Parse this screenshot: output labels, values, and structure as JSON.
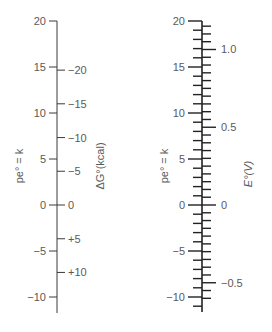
{
  "diagram": {
    "type": "nomogram",
    "left_scale": {
      "axis_label": "pe° = k",
      "secondary_label": "ΔG°(kcal)",
      "pe_range": [
        -11.5,
        20
      ],
      "major_ticks": [
        {
          "pe": 20,
          "label": "20"
        },
        {
          "pe": 15,
          "label": "15"
        },
        {
          "pe": 10,
          "label": "10"
        },
        {
          "pe": 5,
          "label": "5"
        },
        {
          "pe": 0,
          "label": "0"
        },
        {
          "pe": -5,
          "label": "−5"
        },
        {
          "pe": -10,
          "label": "−10"
        }
      ],
      "secondary_ticks": [
        {
          "pe": 14.66,
          "label": "−20"
        },
        {
          "pe": 11.0,
          "label": "−15"
        },
        {
          "pe": 7.33,
          "label": "−10"
        },
        {
          "pe": 3.67,
          "label": "−5"
        },
        {
          "pe": 0,
          "label": "0"
        },
        {
          "pe": -3.67,
          "label": "+5"
        },
        {
          "pe": -7.33,
          "label": "+10"
        }
      ]
    },
    "right_scale": {
      "axis_label": "pe° = k",
      "secondary_label": "E°(V)",
      "pe_range": [
        -11.5,
        20
      ],
      "major_ticks": [
        {
          "pe": 20,
          "label": "20"
        },
        {
          "pe": 15,
          "label": "15"
        },
        {
          "pe": 10,
          "label": "10"
        },
        {
          "pe": 5,
          "label": "5"
        },
        {
          "pe": 0,
          "label": "0"
        },
        {
          "pe": -5,
          "label": "−5"
        },
        {
          "pe": -10,
          "label": "−10"
        }
      ],
      "secondary_ticks": [
        {
          "volts": 1.0,
          "label": "1.0"
        },
        {
          "volts": 0.5,
          "label": "0.5"
        },
        {
          "volts": 0.0,
          "label": "0"
        },
        {
          "volts": -0.5,
          "label": "−0.5"
        }
      ],
      "minor_pe_step": 1,
      "minor_volt_step": 0.05,
      "volts_per_pe": 0.05916
    },
    "colors": {
      "line": "#3a3a3a",
      "text": "#5a5a5a",
      "background": "#ffffff"
    }
  }
}
